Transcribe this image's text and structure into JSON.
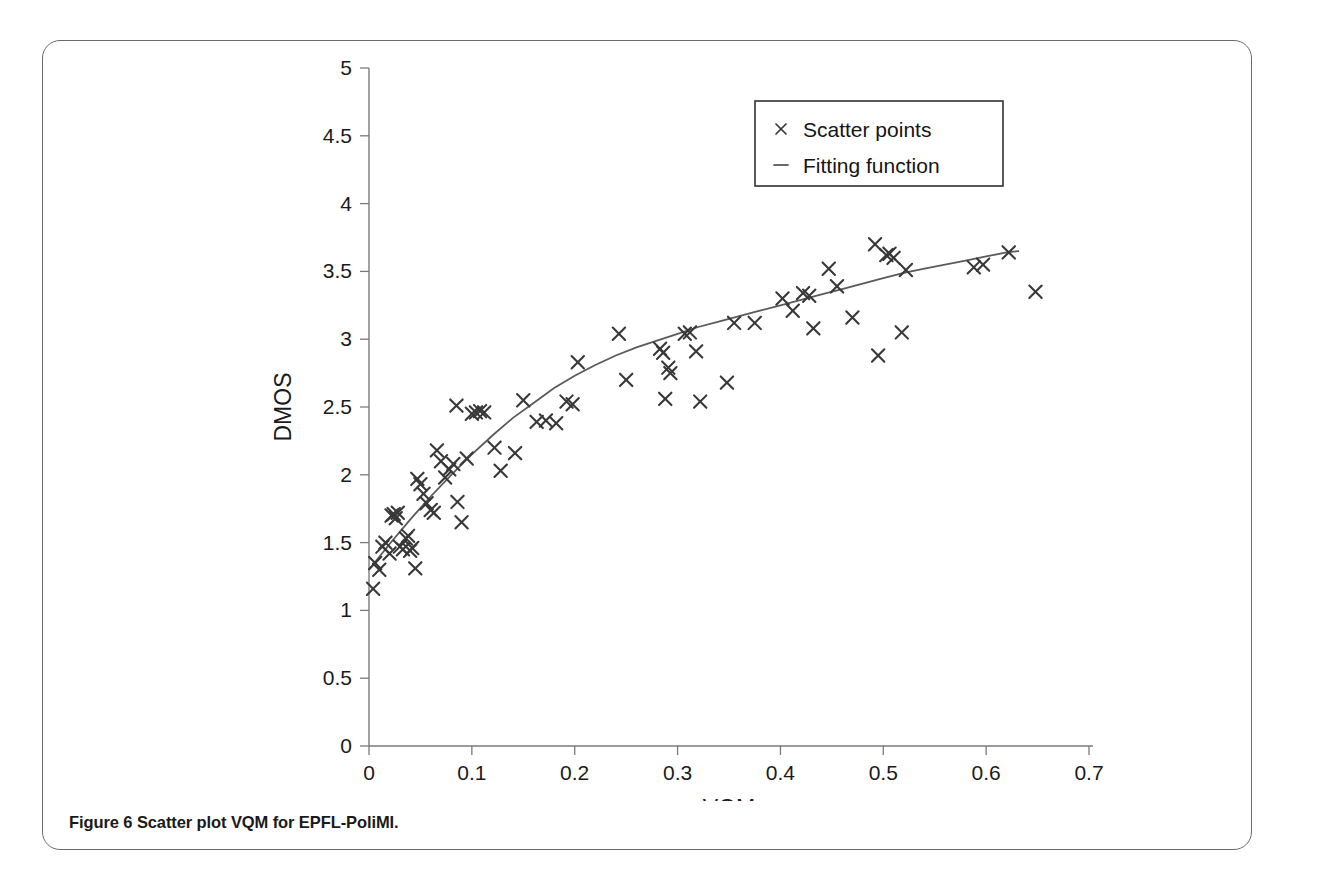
{
  "caption": {
    "label": "Figure 6",
    "text": "Scatter plot VQM for EPFL-PoliMI."
  },
  "chart_data": {
    "type": "scatter",
    "title": "",
    "xlabel": "VQM",
    "ylabel": "DMOS",
    "xlim": [
      0,
      0.7
    ],
    "ylim": [
      0,
      5
    ],
    "xticks": [
      0,
      0.1,
      0.2,
      0.3,
      0.4,
      0.5,
      0.6,
      0.7
    ],
    "xtick_labels": [
      "0",
      "0.1",
      "0.2",
      "0.3",
      "0.4",
      "0.5",
      "0.6",
      "0.7"
    ],
    "yticks": [
      0,
      0.5,
      1,
      1.5,
      2,
      2.5,
      3,
      3.5,
      4,
      4.5,
      5
    ],
    "ytick_labels": [
      "0",
      "0.5",
      "1",
      "1.5",
      "2",
      "2.5",
      "3",
      "3.5",
      "4",
      "4.5",
      "5"
    ],
    "grid": false,
    "legend_position": "top-right",
    "legend": [
      {
        "marker": "x",
        "label": "Scatter points"
      },
      {
        "marker": "-",
        "label": "Fitting function"
      }
    ],
    "series": [
      {
        "name": "Scatter points",
        "marker": "x",
        "color": "#383838",
        "points": [
          [
            0.004,
            1.16
          ],
          [
            0.006,
            1.35
          ],
          [
            0.01,
            1.3
          ],
          [
            0.013,
            1.47
          ],
          [
            0.016,
            1.5
          ],
          [
            0.02,
            1.42
          ],
          [
            0.022,
            1.7
          ],
          [
            0.024,
            1.71
          ],
          [
            0.026,
            1.68
          ],
          [
            0.028,
            1.72
          ],
          [
            0.03,
            1.47
          ],
          [
            0.033,
            1.45
          ],
          [
            0.036,
            1.53
          ],
          [
            0.038,
            1.55
          ],
          [
            0.04,
            1.44
          ],
          [
            0.042,
            1.46
          ],
          [
            0.045,
            1.31
          ],
          [
            0.047,
            1.97
          ],
          [
            0.05,
            1.93
          ],
          [
            0.053,
            1.86
          ],
          [
            0.056,
            1.79
          ],
          [
            0.06,
            1.74
          ],
          [
            0.063,
            1.72
          ],
          [
            0.066,
            2.18
          ],
          [
            0.07,
            2.1
          ],
          [
            0.074,
            1.98
          ],
          [
            0.078,
            2.04
          ],
          [
            0.082,
            2.08
          ],
          [
            0.085,
            2.51
          ],
          [
            0.086,
            1.8
          ],
          [
            0.09,
            1.65
          ],
          [
            0.095,
            2.12
          ],
          [
            0.1,
            2.45
          ],
          [
            0.104,
            2.46
          ],
          [
            0.108,
            2.47
          ],
          [
            0.112,
            2.46
          ],
          [
            0.122,
            2.2
          ],
          [
            0.128,
            2.03
          ],
          [
            0.142,
            2.16
          ],
          [
            0.15,
            2.55
          ],
          [
            0.163,
            2.39
          ],
          [
            0.172,
            2.4
          ],
          [
            0.182,
            2.38
          ],
          [
            0.192,
            2.54
          ],
          [
            0.198,
            2.52
          ],
          [
            0.203,
            2.83
          ],
          [
            0.243,
            3.04
          ],
          [
            0.25,
            2.7
          ],
          [
            0.283,
            2.93
          ],
          [
            0.286,
            2.9
          ],
          [
            0.288,
            2.56
          ],
          [
            0.291,
            2.79
          ],
          [
            0.293,
            2.75
          ],
          [
            0.307,
            3.04
          ],
          [
            0.312,
            3.05
          ],
          [
            0.318,
            2.91
          ],
          [
            0.322,
            2.54
          ],
          [
            0.348,
            2.68
          ],
          [
            0.355,
            3.12
          ],
          [
            0.375,
            3.12
          ],
          [
            0.402,
            3.3
          ],
          [
            0.412,
            3.21
          ],
          [
            0.422,
            3.34
          ],
          [
            0.428,
            3.32
          ],
          [
            0.432,
            3.08
          ],
          [
            0.447,
            3.52
          ],
          [
            0.455,
            3.39
          ],
          [
            0.47,
            3.16
          ],
          [
            0.492,
            3.7
          ],
          [
            0.495,
            2.88
          ],
          [
            0.503,
            3.62
          ],
          [
            0.506,
            3.63
          ],
          [
            0.51,
            3.6
          ],
          [
            0.518,
            3.05
          ],
          [
            0.522,
            3.51
          ],
          [
            0.588,
            3.53
          ],
          [
            0.597,
            3.55
          ],
          [
            0.622,
            3.64
          ],
          [
            0.648,
            3.35
          ]
        ]
      },
      {
        "name": "Fitting function",
        "type": "line",
        "color": "#5a5a5a",
        "description": "Logarithmic-style fit rising from DMOS 1.30 at VQM 0 to DMOS 3.65 at VQM 0.63",
        "points": [
          [
            0.0,
            1.3
          ],
          [
            0.02,
            1.49
          ],
          [
            0.04,
            1.67
          ],
          [
            0.06,
            1.84
          ],
          [
            0.08,
            2.0
          ],
          [
            0.1,
            2.15
          ],
          [
            0.12,
            2.29
          ],
          [
            0.14,
            2.42
          ],
          [
            0.16,
            2.53
          ],
          [
            0.18,
            2.64
          ],
          [
            0.2,
            2.73
          ],
          [
            0.22,
            2.81
          ],
          [
            0.24,
            2.88
          ],
          [
            0.26,
            2.94
          ],
          [
            0.28,
            2.99
          ],
          [
            0.3,
            3.04
          ],
          [
            0.32,
            3.09
          ],
          [
            0.34,
            3.13
          ],
          [
            0.36,
            3.17
          ],
          [
            0.38,
            3.21
          ],
          [
            0.4,
            3.25
          ],
          [
            0.42,
            3.29
          ],
          [
            0.44,
            3.33
          ],
          [
            0.46,
            3.37
          ],
          [
            0.48,
            3.41
          ],
          [
            0.5,
            3.45
          ],
          [
            0.52,
            3.49
          ],
          [
            0.54,
            3.52
          ],
          [
            0.56,
            3.55
          ],
          [
            0.58,
            3.58
          ],
          [
            0.6,
            3.61
          ],
          [
            0.62,
            3.64
          ],
          [
            0.632,
            3.65
          ]
        ]
      }
    ]
  }
}
